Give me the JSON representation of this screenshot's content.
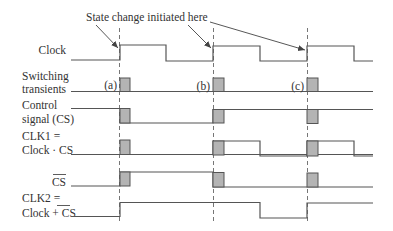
{
  "annotation": {
    "text": "State change initiated here",
    "arrow_targets": [
      "a",
      "b",
      "c"
    ]
  },
  "markers": [
    {
      "id": "a",
      "label": "(a)",
      "x": 120
    },
    {
      "id": "b",
      "label": "(b)",
      "x": 213
    },
    {
      "id": "c",
      "label": "(c)",
      "x": 307
    }
  ],
  "signals": [
    {
      "name": "clock",
      "label_lines": [
        "Clock"
      ],
      "overline": false
    },
    {
      "name": "switching-transients",
      "label_lines": [
        "Switching",
        "transients"
      ],
      "overline": false
    },
    {
      "name": "control-signal",
      "label_lines": [
        "Control",
        "signal (CS)"
      ],
      "overline": false
    },
    {
      "name": "clk1",
      "label_lines": [
        "CLK1 =",
        "Clock · CS"
      ],
      "overline": false
    },
    {
      "name": "cs-bar",
      "label_lines": [
        "CS"
      ],
      "overline": true
    },
    {
      "name": "clk2",
      "label_lines": [
        "CLK2 =",
        "Clock + CS"
      ],
      "overline": true
    }
  ],
  "labels": {
    "clock": "Clock",
    "switching_1": "Switching",
    "switching_2": "transients",
    "control_1": "Control",
    "control_2": "signal (CS)",
    "clk1_1": "CLK1 =",
    "clk1_2": "Clock · CS",
    "csbar": "CS",
    "clk2_1": "CLK2 =",
    "clk2_2": "Clock + CS"
  },
  "colors": {
    "line": "#555555",
    "transient_fill": "#b4b4b4",
    "text": "#333333"
  }
}
